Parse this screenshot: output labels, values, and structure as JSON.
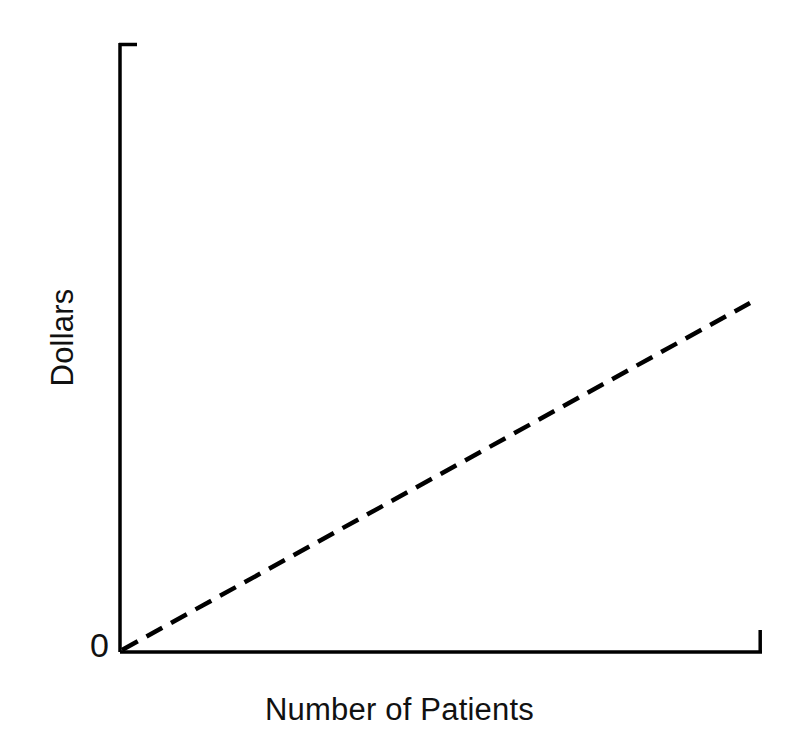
{
  "chart_data": {
    "type": "line",
    "title": "",
    "subtitle": "",
    "xlabel": "Number of Patients",
    "ylabel": "Dollars",
    "origin_label": "0",
    "grid": false,
    "legend": null,
    "legend_position": "none",
    "axis_style": "open-L-with-end-caps",
    "xlim": [
      0,
      100
    ],
    "ylim": [
      0,
      100
    ],
    "x_tick_labels": [],
    "y_tick_labels": [],
    "annotations": [],
    "series": [
      {
        "name": "Cost",
        "style": "dashed",
        "color": "#000000",
        "x": [
          0,
          10,
          20,
          30,
          40,
          50,
          60,
          70,
          80,
          90,
          98
        ],
        "y": [
          0,
          5.7,
          11.4,
          17.1,
          22.8,
          28.5,
          34.2,
          39.9,
          45.6,
          51.3,
          55.9
        ]
      }
    ]
  },
  "geometry": {
    "axis_color": "#000000",
    "axis_width_px": 3.5,
    "dash_width_px": 4.5,
    "dash_pattern": "18 10",
    "x_axis": {
      "x1": 120,
      "y1": 652,
      "x2": 762,
      "y2": 652
    },
    "y_axis": {
      "x1": 120,
      "y1": 43,
      "x2": 120,
      "y2": 652
    },
    "y_axis_top_cap": {
      "x1": 120,
      "y1": 44,
      "x2": 136,
      "y2": 44
    },
    "x_axis_end_cap": {
      "x1": 760,
      "y1": 652,
      "x2": 760,
      "y2": 631
    },
    "trend_line": {
      "x1": 122,
      "y1": 650,
      "x2": 750,
      "y2": 303
    }
  }
}
